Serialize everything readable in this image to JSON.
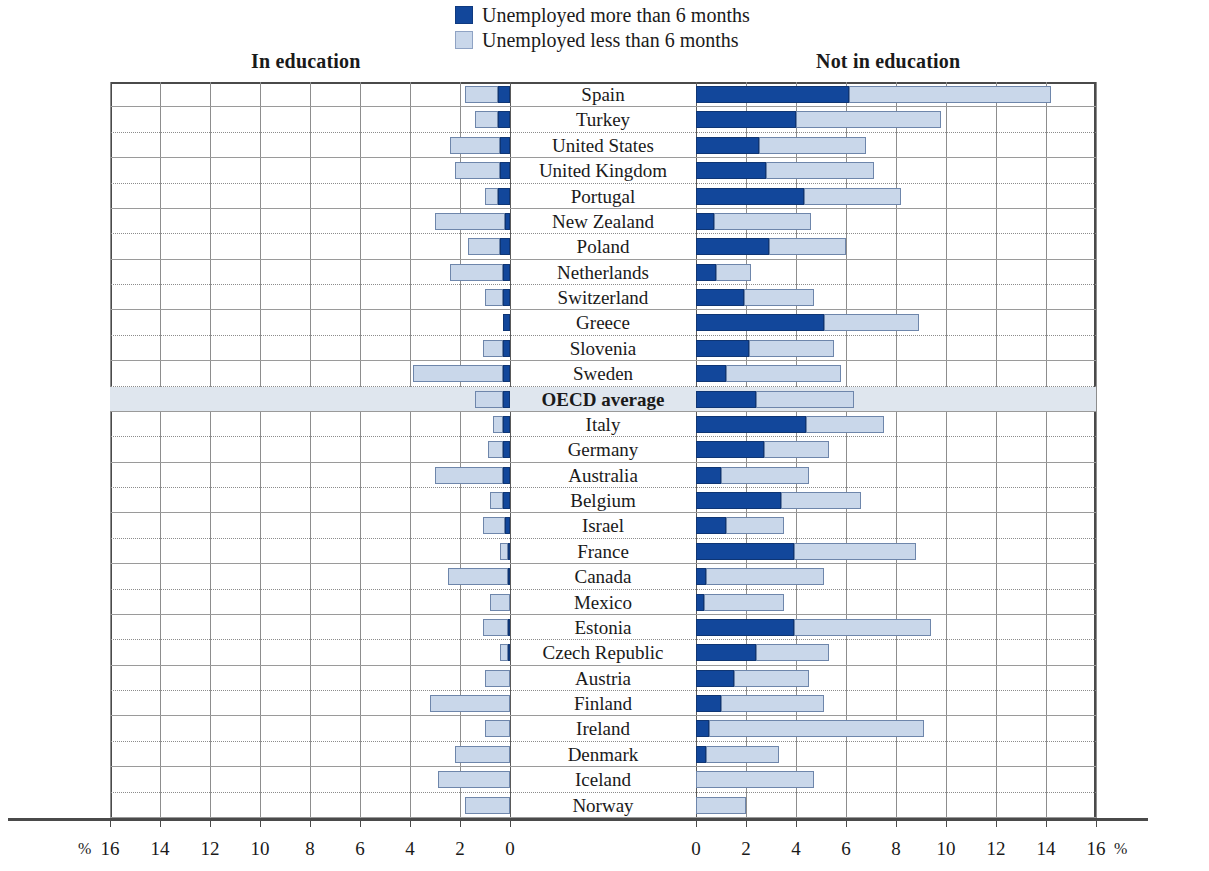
{
  "legend": {
    "items": [
      {
        "label": "Unemployed more than 6 months",
        "color": "#12479b",
        "swatch": "dark"
      },
      {
        "label": "Unemployed less than 6 months",
        "color": "#c9d7ea",
        "swatch": "light"
      }
    ]
  },
  "headings": {
    "left": "In education",
    "right": "Not in education"
  },
  "axis": {
    "left_ticks": [
      "16",
      "14",
      "12",
      "10",
      "8",
      "6",
      "4",
      "2",
      "0"
    ],
    "right_ticks": [
      "0",
      "2",
      "4",
      "6",
      "8",
      "10",
      "12",
      "14",
      "16"
    ],
    "unit_left": "%",
    "unit_right": "%",
    "max": 16,
    "step": 2
  },
  "chart_data": {
    "type": "bar",
    "title": "",
    "subtitle": "",
    "xlabel": "%",
    "ylabel": "",
    "xlim": [
      0,
      16
    ],
    "grid": true,
    "legend_position": "top-center",
    "orientation": "horizontal",
    "stacked": true,
    "panels": [
      "In education",
      "Not in education"
    ],
    "series": [
      {
        "name": "Unemployed more than 6 months",
        "color": "#12479b"
      },
      {
        "name": "Unemployed less than 6 months",
        "color": "#c9d7ea"
      }
    ],
    "categories": [
      "Spain",
      "Turkey",
      "United States",
      "United Kingdom",
      "Portugal",
      "New Zealand",
      "Poland",
      "Netherlands",
      "Switzerland",
      "Greece",
      "Slovenia",
      "Sweden",
      "OECD average",
      "Italy",
      "Germany",
      "Australia",
      "Belgium",
      "Israel",
      "France",
      "Canada",
      "Mexico",
      "Estonia",
      "Czech Republic",
      "Austria",
      "Finland",
      "Ireland",
      "Denmark",
      "Iceland",
      "Norway"
    ],
    "rows": [
      {
        "country": "Spain",
        "highlight": false,
        "in_edu_more": 0.5,
        "in_edu_less": 1.3,
        "not_edu_more": 6.1,
        "not_edu_less": 8.1
      },
      {
        "country": "Turkey",
        "highlight": false,
        "in_edu_more": 0.5,
        "in_edu_less": 0.9,
        "not_edu_more": 4.0,
        "not_edu_less": 5.8
      },
      {
        "country": "United States",
        "highlight": false,
        "in_edu_more": 0.4,
        "in_edu_less": 2.0,
        "not_edu_more": 2.5,
        "not_edu_less": 4.3
      },
      {
        "country": "United Kingdom",
        "highlight": false,
        "in_edu_more": 0.4,
        "in_edu_less": 1.8,
        "not_edu_more": 2.8,
        "not_edu_less": 4.3
      },
      {
        "country": "Portugal",
        "highlight": false,
        "in_edu_more": 0.5,
        "in_edu_less": 0.5,
        "not_edu_more": 4.3,
        "not_edu_less": 3.9
      },
      {
        "country": "New Zealand",
        "highlight": false,
        "in_edu_more": 0.2,
        "in_edu_less": 2.8,
        "not_edu_more": 0.7,
        "not_edu_less": 3.9
      },
      {
        "country": "Poland",
        "highlight": false,
        "in_edu_more": 0.4,
        "in_edu_less": 1.3,
        "not_edu_more": 2.9,
        "not_edu_less": 3.1
      },
      {
        "country": "Netherlands",
        "highlight": false,
        "in_edu_more": 0.3,
        "in_edu_less": 2.1,
        "not_edu_more": 0.8,
        "not_edu_less": 1.4
      },
      {
        "country": "Switzerland",
        "highlight": false,
        "in_edu_more": 0.3,
        "in_edu_less": 0.7,
        "not_edu_more": 1.9,
        "not_edu_less": 2.8
      },
      {
        "country": "Greece",
        "highlight": false,
        "in_edu_more": 0.3,
        "in_edu_less": 0.0,
        "not_edu_more": 5.1,
        "not_edu_less": 3.8
      },
      {
        "country": "Slovenia",
        "highlight": false,
        "in_edu_more": 0.3,
        "in_edu_less": 0.8,
        "not_edu_more": 2.1,
        "not_edu_less": 3.4
      },
      {
        "country": "Sweden",
        "highlight": false,
        "in_edu_more": 0.3,
        "in_edu_less": 3.6,
        "not_edu_more": 1.2,
        "not_edu_less": 4.6
      },
      {
        "country": "OECD average",
        "highlight": true,
        "in_edu_more": 0.3,
        "in_edu_less": 1.1,
        "not_edu_more": 2.4,
        "not_edu_less": 3.9
      },
      {
        "country": "Italy",
        "highlight": false,
        "in_edu_more": 0.3,
        "in_edu_less": 0.4,
        "not_edu_more": 4.4,
        "not_edu_less": 3.1
      },
      {
        "country": "Germany",
        "highlight": false,
        "in_edu_more": 0.3,
        "in_edu_less": 0.6,
        "not_edu_more": 2.7,
        "not_edu_less": 2.6
      },
      {
        "country": "Australia",
        "highlight": false,
        "in_edu_more": 0.3,
        "in_edu_less": 2.7,
        "not_edu_more": 1.0,
        "not_edu_less": 3.5
      },
      {
        "country": "Belgium",
        "highlight": false,
        "in_edu_more": 0.3,
        "in_edu_less": 0.5,
        "not_edu_more": 3.4,
        "not_edu_less": 3.2
      },
      {
        "country": "Israel",
        "highlight": false,
        "in_edu_more": 0.2,
        "in_edu_less": 0.9,
        "not_edu_more": 1.2,
        "not_edu_less": 2.3
      },
      {
        "country": "France",
        "highlight": false,
        "in_edu_more": 0.1,
        "in_edu_less": 0.3,
        "not_edu_more": 3.9,
        "not_edu_less": 4.9
      },
      {
        "country": "Canada",
        "highlight": false,
        "in_edu_more": 0.1,
        "in_edu_less": 2.4,
        "not_edu_more": 0.4,
        "not_edu_less": 4.7
      },
      {
        "country": "Mexico",
        "highlight": false,
        "in_edu_more": 0.0,
        "in_edu_less": 0.8,
        "not_edu_more": 0.3,
        "not_edu_less": 3.2
      },
      {
        "country": "Estonia",
        "highlight": false,
        "in_edu_more": 0.1,
        "in_edu_less": 1.0,
        "not_edu_more": 3.9,
        "not_edu_less": 5.5
      },
      {
        "country": "Czech Republic",
        "highlight": false,
        "in_edu_more": 0.1,
        "in_edu_less": 0.3,
        "not_edu_more": 2.4,
        "not_edu_less": 2.9
      },
      {
        "country": "Austria",
        "highlight": false,
        "in_edu_more": 0.0,
        "in_edu_less": 1.0,
        "not_edu_more": 1.5,
        "not_edu_less": 3.0
      },
      {
        "country": "Finland",
        "highlight": false,
        "in_edu_more": 0.0,
        "in_edu_less": 3.2,
        "not_edu_more": 1.0,
        "not_edu_less": 4.1
      },
      {
        "country": "Ireland",
        "highlight": false,
        "in_edu_more": 0.0,
        "in_edu_less": 1.0,
        "not_edu_more": 0.5,
        "not_edu_less": 8.6
      },
      {
        "country": "Denmark",
        "highlight": false,
        "in_edu_more": 0.0,
        "in_edu_less": 2.2,
        "not_edu_more": 0.4,
        "not_edu_less": 2.9
      },
      {
        "country": "Iceland",
        "highlight": false,
        "in_edu_more": 0.0,
        "in_edu_less": 2.9,
        "not_edu_more": 0.0,
        "not_edu_less": 4.7
      },
      {
        "country": "Norway",
        "highlight": false,
        "in_edu_more": 0.0,
        "in_edu_less": 1.8,
        "not_edu_more": 0.0,
        "not_edu_less": 2.0
      }
    ]
  }
}
